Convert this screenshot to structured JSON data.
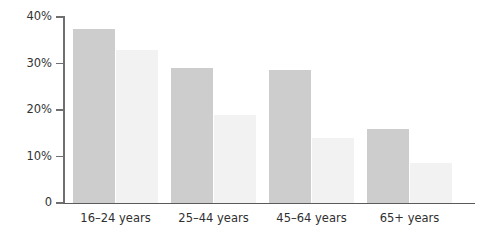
{
  "chart_data": {
    "type": "bar",
    "title": "",
    "subtitle": "",
    "xlabel": "",
    "ylabel": "",
    "ylim": [
      0,
      40
    ],
    "yticks": [
      0,
      10,
      20,
      30,
      40
    ],
    "ytick_labels": [
      "0",
      "10%",
      "20%",
      "30%",
      "40%"
    ],
    "grid": false,
    "legend": "none",
    "categories": [
      "16–24 years",
      "25–44 years",
      "45–64 years",
      "65+ years"
    ],
    "series": [
      {
        "name": "series-1",
        "color": "#cdcdcd",
        "values": [
          37.5,
          29.0,
          28.5,
          16.0
        ]
      },
      {
        "name": "series-2",
        "color": "#f2f2f2",
        "values": [
          33.0,
          19.0,
          14.0,
          8.5
        ]
      }
    ],
    "annotations": []
  },
  "axis": {
    "y_tick_labels": [
      "40%",
      "30%",
      "20%",
      "10%",
      "0"
    ],
    "y_tick_values": [
      40,
      30,
      20,
      10,
      0
    ]
  },
  "colors": {
    "axis_line": "#5a5a5a",
    "tick_line": "#6f6f6f",
    "tick_text": "#333333",
    "category_text": "#2f2f2f",
    "background": "#ffffff",
    "bar_dark": "#cdcdcd",
    "bar_light": "#f2f2f2"
  }
}
